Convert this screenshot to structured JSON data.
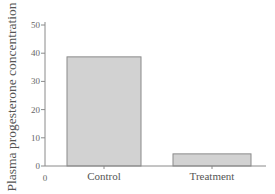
{
  "chart_data": {
    "type": "bar",
    "title": "",
    "xlabel": "",
    "ylabel": "Plasma progesterone concentration",
    "categories": [
      "Control",
      "Treatment"
    ],
    "values": [
      38.7,
      4.3
    ],
    "ylim": [
      0,
      50
    ],
    "yticks": [
      0,
      10,
      20,
      30,
      40,
      50
    ],
    "x_origin_label": "0",
    "grid": false,
    "legend": null,
    "colors": {
      "bar_fill": "#d2d2d2",
      "bar_stroke": "#8a8a8a",
      "axis": "#8a8a8a"
    }
  }
}
